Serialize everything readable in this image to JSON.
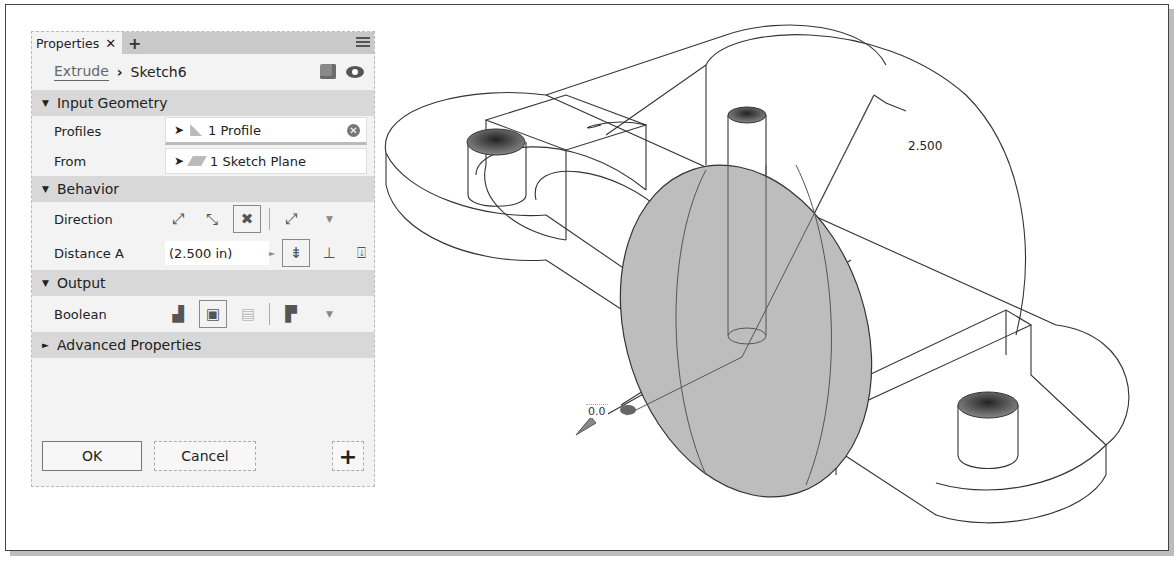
{
  "panel": {
    "tab_label": "Properties",
    "tab_close": "✕",
    "tab_add": "+",
    "breadcrumb": {
      "feature": "Extrude",
      "separator": "›",
      "sketch": "Sketch6"
    },
    "sections": {
      "input_geometry": {
        "title": "Input Geometry",
        "expanded": "▼"
      },
      "behavior": {
        "title": "Behavior",
        "expanded": "▼"
      },
      "output": {
        "title": "Output",
        "expanded": "▼"
      },
      "advanced": {
        "title": "Advanced Properties",
        "expanded": "►"
      }
    },
    "profiles": {
      "label": "Profiles",
      "value": "1 Profile",
      "clear": "✕"
    },
    "from": {
      "label": "From",
      "value": "1 Sketch Plane"
    },
    "direction": {
      "label": "Direction",
      "dropdown": "▼"
    },
    "distance_a": {
      "label": "Distance A",
      "value": "(2.500 in)",
      "arrow": "►"
    },
    "boolean": {
      "label": "Boolean",
      "dropdown": "▼"
    },
    "buttons": {
      "ok": "OK",
      "cancel": "Cancel",
      "add": "+"
    }
  },
  "viewport": {
    "dimension_label": "2.500",
    "manipulator_value": "0.0"
  }
}
